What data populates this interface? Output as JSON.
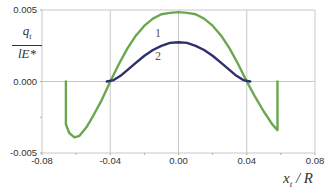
{
  "chart_data": {
    "type": "line",
    "title": "",
    "xlabel": "x_t / R",
    "ylabel": "q_t / lE*",
    "xlim": [
      -0.08,
      0.08
    ],
    "ylim": [
      -0.005,
      0.005
    ],
    "grid": true,
    "legend": "inline curve labels",
    "x_ticks": [
      "-0.08",
      "-0.04",
      "0.00",
      "0.04",
      "0.08"
    ],
    "y_ticks": [
      "0.005",
      "0.000",
      "-0.005"
    ],
    "series": [
      {
        "name": "1",
        "color": "#6aa84f",
        "points": [
          [
            -0.066,
            0.0
          ],
          [
            -0.066,
            -0.003
          ],
          [
            -0.064,
            -0.0036
          ],
          [
            -0.061,
            -0.0039
          ],
          [
            -0.058,
            -0.0038
          ],
          [
            -0.054,
            -0.0032
          ],
          [
            -0.05,
            -0.0024
          ],
          [
            -0.045,
            -0.0013
          ],
          [
            -0.04,
            0.0
          ],
          [
            -0.035,
            0.0012
          ],
          [
            -0.03,
            0.0023
          ],
          [
            -0.025,
            0.0032
          ],
          [
            -0.02,
            0.0039
          ],
          [
            -0.015,
            0.0044
          ],
          [
            -0.01,
            0.0047
          ],
          [
            -0.005,
            0.0048
          ],
          [
            0.0,
            0.00485
          ],
          [
            0.005,
            0.0048
          ],
          [
            0.01,
            0.0047
          ],
          [
            0.015,
            0.0044
          ],
          [
            0.02,
            0.0039
          ],
          [
            0.025,
            0.0032
          ],
          [
            0.03,
            0.0023
          ],
          [
            0.035,
            0.0012
          ],
          [
            0.04,
            0.0
          ],
          [
            0.045,
            -0.0011
          ],
          [
            0.05,
            -0.0021
          ],
          [
            0.055,
            -0.003
          ],
          [
            0.058,
            -0.0034
          ],
          [
            0.058,
            0.0
          ]
        ]
      },
      {
        "name": "2",
        "color": "#2e2f6e",
        "points": [
          [
            -0.042,
            0.0
          ],
          [
            -0.038,
            0.0001
          ],
          [
            -0.034,
            0.0004
          ],
          [
            -0.03,
            0.0008
          ],
          [
            -0.025,
            0.0013
          ],
          [
            -0.02,
            0.0018
          ],
          [
            -0.015,
            0.0022
          ],
          [
            -0.01,
            0.0025
          ],
          [
            -0.005,
            0.0027
          ],
          [
            0.0,
            0.00275
          ],
          [
            0.005,
            0.0027
          ],
          [
            0.01,
            0.0025
          ],
          [
            0.015,
            0.0022
          ],
          [
            0.02,
            0.0018
          ],
          [
            0.025,
            0.0013
          ],
          [
            0.03,
            0.0008
          ],
          [
            0.034,
            0.0004
          ],
          [
            0.038,
            0.0001
          ],
          [
            0.042,
            0.0
          ]
        ]
      }
    ],
    "annotations": [
      {
        "text": "1",
        "x": -0.012,
        "y": 0.0034
      },
      {
        "text": "2",
        "x": -0.012,
        "y": 0.0018
      }
    ]
  },
  "labels": {
    "y_num": "q",
    "y_num_sub": "t",
    "y_den": "lE*",
    "x_main": "x",
    "x_sub": "t",
    "x_rest": " / R"
  }
}
